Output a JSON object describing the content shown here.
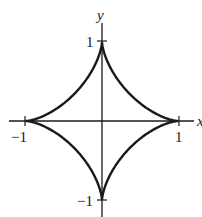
{
  "chart_data": {
    "type": "line",
    "title": "",
    "equation": "x^(2/3) + y^(2/3) = 1",
    "xlabel": "x",
    "ylabel": "y",
    "xlim": [
      -1.3,
      1.2
    ],
    "ylim": [
      -1.2,
      1.3
    ],
    "grid": false,
    "legend": null,
    "x_ticks": [
      -1,
      1
    ],
    "x_tick_labels": [
      "−1",
      "1"
    ],
    "y_ticks": [
      -1,
      1
    ],
    "y_tick_labels": [
      "−1",
      "1"
    ],
    "series": [
      {
        "name": "astroid",
        "parametric": "x = cos^3(t), y = sin^3(t), t in [0, 2pi]",
        "x": [
          1,
          0.65,
          0.35,
          0.125,
          0.03,
          0,
          -0.03,
          -0.125,
          -0.35,
          -0.65,
          -1,
          -0.65,
          -0.35,
          -0.125,
          -0.03,
          0,
          0.03,
          0.125,
          0.35,
          0.65,
          1
        ],
        "y": [
          0,
          0.03,
          0.125,
          0.35,
          0.65,
          1,
          0.65,
          0.35,
          0.125,
          0.03,
          0,
          -0.03,
          -0.125,
          -0.35,
          -0.65,
          -1,
          -0.65,
          -0.35,
          -0.125,
          -0.03,
          0
        ]
      }
    ]
  },
  "labels": {
    "x_axis": "x",
    "y_axis": "y",
    "x_neg_one": "−1",
    "x_pos_one": "1",
    "y_pos_one": "1",
    "y_neg_one": "−1"
  }
}
